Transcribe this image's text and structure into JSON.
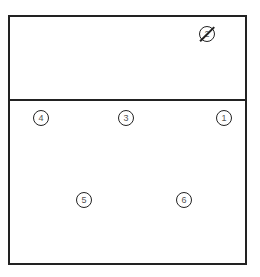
{
  "diagram": {
    "type": "court-positions",
    "positions": [
      {
        "id": "1",
        "label": "1",
        "x": 224,
        "y": 118
      },
      {
        "id": "2",
        "label": "2",
        "x": 207,
        "y": 34,
        "struck": true
      },
      {
        "id": "3",
        "label": "3",
        "x": 126,
        "y": 118
      },
      {
        "id": "4",
        "label": "4",
        "x": 41,
        "y": 118
      },
      {
        "id": "5",
        "label": "5",
        "x": 84,
        "y": 200
      },
      {
        "id": "6",
        "label": "6",
        "x": 184,
        "y": 200
      }
    ]
  }
}
